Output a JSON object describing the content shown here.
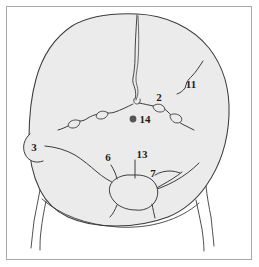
{
  "figure": {
    "view": "posterior",
    "frame_color": "#a8a8a8",
    "background_color": "#ffffff",
    "bone_fill_color": "#ebebeb",
    "outline_color": "#3c3c3c",
    "suture_color": "#3c3c3c",
    "marker_color": "#555555"
  },
  "labels": [
    {
      "id": "label-2",
      "text": "2",
      "x": 159,
      "y": 101,
      "structure": "lambdoid-suture-wormian-bone"
    },
    {
      "id": "label-3",
      "text": "3",
      "x": 34,
      "y": 151,
      "structure": "mastoid-process"
    },
    {
      "id": "label-6",
      "text": "6",
      "x": 108,
      "y": 161,
      "structure": "occipital-condyle-region"
    },
    {
      "id": "label-7",
      "text": "7",
      "x": 153,
      "y": 177,
      "structure": "inferior-nuchal-line"
    },
    {
      "id": "label-11",
      "text": "11",
      "x": 191,
      "y": 88,
      "structure": "parietal-foramen-region"
    },
    {
      "id": "label-13",
      "text": "13",
      "x": 137,
      "y": 158,
      "structure": "foramen-magnum"
    },
    {
      "id": "label-14",
      "text": "14",
      "x": 139,
      "y": 123,
      "structure": "external-occipital-protuberance"
    }
  ],
  "markers": [
    {
      "id": "marker-14",
      "cx": 133,
      "cy": 119,
      "r": 3.4,
      "color": "#555555",
      "structure": "external-occipital-protuberance-point"
    }
  ]
}
